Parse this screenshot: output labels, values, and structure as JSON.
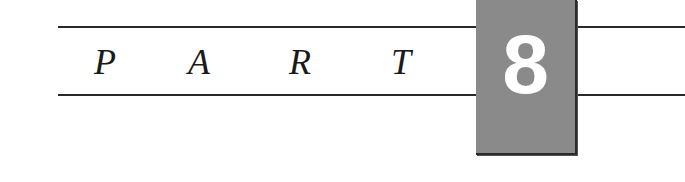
{
  "heading": {
    "letters": [
      "P",
      "A",
      "R",
      "T"
    ],
    "number": "8"
  },
  "colors": {
    "rule": "#2a2a2a",
    "box_fill": "#8a8a8a",
    "number_text": "#ffffff",
    "letter_text": "#1a1a1a"
  }
}
